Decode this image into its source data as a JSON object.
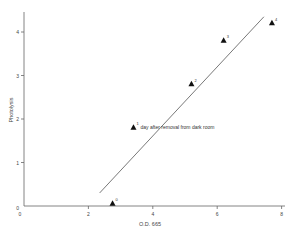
{
  "chart_data": {
    "type": "scatter",
    "title": "",
    "xlabel": "O.D. 665",
    "ylabel": "Photolysis",
    "xlim": [
      0,
      8.1
    ],
    "ylim": [
      0,
      4.5
    ],
    "x_ticks": [
      "0",
      "2",
      "4",
      "6",
      "8"
    ],
    "y_ticks": [
      "0",
      "1",
      "2",
      "3",
      "4"
    ],
    "grid": false,
    "series": [
      {
        "name": "Measurements",
        "marker": "triangle",
        "points": [
          {
            "x": 2.75,
            "y": 0.05,
            "label": "0"
          },
          {
            "x": 3.4,
            "y": 1.8,
            "label": "1"
          },
          {
            "x": 5.2,
            "y": 2.8,
            "label": "2"
          },
          {
            "x": 6.2,
            "y": 3.8,
            "label": "3"
          },
          {
            "x": 7.7,
            "y": 4.2,
            "label": "4"
          }
        ]
      },
      {
        "name": "Fit line",
        "type": "line",
        "points": [
          {
            "x": 2.35,
            "y": 0.3
          },
          {
            "x": 7.45,
            "y": 4.35
          }
        ]
      }
    ],
    "annotations": [
      {
        "text": "day after removal from dark room",
        "near_point": "1"
      }
    ]
  }
}
